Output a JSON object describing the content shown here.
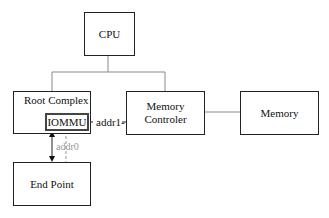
{
  "diagram": {
    "nodes": {
      "cpu": {
        "label": "CPU"
      },
      "root_complex": {
        "label": "Root Complex"
      },
      "iommu": {
        "label": "IOMMU"
      },
      "memory_controller": {
        "label_line1": "Memory",
        "label_line2": "Controler"
      },
      "memory": {
        "label": "Memory"
      },
      "end_point": {
        "label": "End Point"
      }
    },
    "edges": {
      "addr1": {
        "label": "addr1-"
      },
      "addr0": {
        "label": "addr0"
      }
    },
    "colors": {
      "line": "#222222",
      "connector": "#888888",
      "addr0": "#999999"
    }
  }
}
